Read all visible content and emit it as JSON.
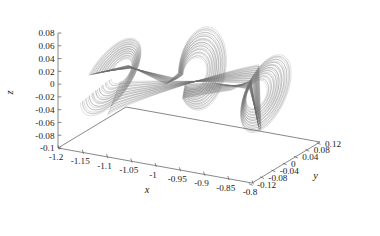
{
  "chart_data": {
    "type": "line",
    "title": "",
    "subtitle": "",
    "projection": "3d",
    "xlabel": "x",
    "ylabel": "y",
    "zlabel": "z",
    "xlim": [
      -1.2,
      -0.8
    ],
    "ylim": [
      -0.12,
      0.12
    ],
    "zlim": [
      -0.1,
      0.08
    ],
    "xticks": [
      "-1.2",
      "-1.15",
      "-1.1",
      "-1.05",
      "-1",
      "-0.95",
      "-0.9",
      "-0.85",
      "-0.8"
    ],
    "xtick_values": [
      -1.2,
      -1.15,
      -1.1,
      -1.05,
      -1.0,
      -0.95,
      -0.9,
      -0.85,
      -0.8
    ],
    "yticks": [
      "-0.12",
      "-0.08",
      "-0.04",
      "0",
      "0.04",
      "0.08",
      "0.12"
    ],
    "ytick_values": [
      -0.12,
      -0.08,
      -0.04,
      0,
      0.04,
      0.08,
      0.12
    ],
    "zticks": [
      "-0.1",
      "-0.08",
      "-0.06",
      "-0.04",
      "-0.02",
      "0",
      "0.02",
      "0.04",
      "0.06",
      "0.08"
    ],
    "ztick_values": [
      -0.1,
      -0.08,
      -0.06,
      -0.04,
      -0.02,
      0,
      0.02,
      0.04,
      0.06,
      0.08
    ],
    "grid": false,
    "legend": null,
    "series": [
      {
        "name": "attractor-trajectory",
        "color": "#6e6e6e",
        "description": "dense chaotic attractor orbit, three lobes: narrow wing lobe at left, large open loop at center, tilted elliptical ring at right",
        "n_orbits": 26
      }
    ]
  },
  "axes": {
    "x_title": "x",
    "y_title": "y",
    "z_title": "z"
  },
  "style": {
    "background": "#ffffff",
    "line_color": "#6e6e6e",
    "axis_color": "#555555",
    "text_color": "#1a1a1a"
  }
}
